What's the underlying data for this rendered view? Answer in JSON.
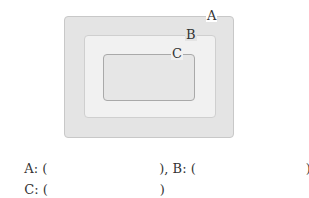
{
  "diagram": {
    "type": "nested-sets",
    "sets": [
      {
        "label": "A",
        "level": "outer",
        "fill": "#e4e4e4"
      },
      {
        "label": "B",
        "level": "middle",
        "fill": "#f1f1f1"
      },
      {
        "label": "C",
        "level": "inner",
        "fill": "#e6e6e6"
      }
    ]
  },
  "answers": {
    "a_prefix": "A: (",
    "a_suffix": "), B: (",
    "b_suffix": "),",
    "c_prefix": "C: (",
    "c_suffix": ")"
  }
}
